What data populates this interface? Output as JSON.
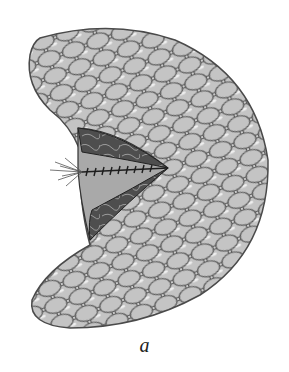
{
  "figure": {
    "caption": "a",
    "colors": {
      "background": "#ffffff",
      "lobule_fill": "#c8c8c8",
      "lobule_outline": "#555555",
      "inner_tissue": "#5a5a5a",
      "suture": "#222222"
    }
  }
}
